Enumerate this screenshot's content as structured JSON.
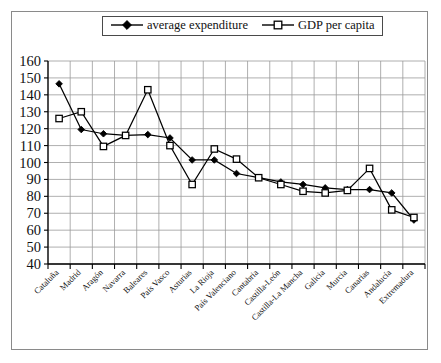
{
  "chart_data": {
    "type": "line",
    "title": "",
    "xlabel": "",
    "ylabel": "",
    "ylim": [
      40,
      160
    ],
    "ytick_step": 10,
    "yticks": [
      40,
      50,
      60,
      70,
      80,
      90,
      100,
      110,
      120,
      130,
      140,
      150,
      160
    ],
    "grid": true,
    "legend_position": "top",
    "categories": [
      "Cataluña",
      "Madrid",
      "Aragón",
      "Navarra",
      "Baleares",
      "País Vasco",
      "Asturias",
      "La Rioja",
      "País Valenciano",
      "Cantabria",
      "Castilla-León",
      "Castilla-La Mancha",
      "Galicia",
      "Murcia",
      "Canarias",
      "Andalucía",
      "Extremadura"
    ],
    "series": [
      {
        "name": "average expenditure",
        "marker": "filled-diamond",
        "color": "#000000",
        "values": [
          146.5,
          119.5,
          117,
          116,
          116.5,
          114.5,
          101.5,
          101.5,
          93.5,
          91,
          88.5,
          87,
          85,
          84,
          84,
          82,
          66
        ]
      },
      {
        "name": "GDP per capita",
        "marker": "open-square",
        "color": "#000000",
        "values": [
          126,
          130,
          109.5,
          116,
          143,
          110,
          87,
          108,
          102,
          91,
          87,
          83,
          82,
          83.5,
          96.5,
          72,
          67.5
        ]
      }
    ]
  },
  "legend": {
    "items": [
      {
        "label": "average expenditure",
        "marker": "filled-diamond"
      },
      {
        "label": "GDP per capita",
        "marker": "open-square"
      }
    ]
  }
}
